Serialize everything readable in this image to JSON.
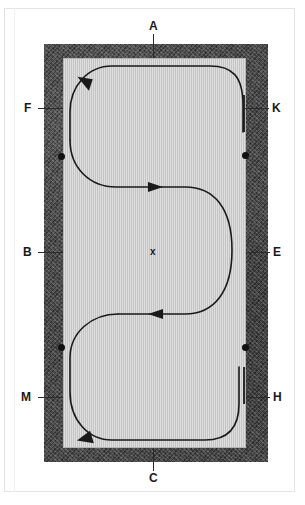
{
  "figure": {
    "type": "technical-diagram",
    "colors": {
      "wall": "#4a4a4a",
      "floor": "#c4c4c4",
      "path": "#1a1a1a",
      "page_rule": "#e4e4e4",
      "label_text": "#1a1a1a"
    }
  },
  "labels": [
    {
      "id": "A",
      "text": "A",
      "position": "top-center",
      "x": 153,
      "y": 26
    },
    {
      "id": "F",
      "text": "F",
      "position": "left-upper",
      "x": 28,
      "y": 108
    },
    {
      "id": "K",
      "text": "K",
      "position": "right-upper",
      "x": 276,
      "y": 108
    },
    {
      "id": "B",
      "text": "B",
      "position": "left-middle",
      "x": 27,
      "y": 252
    },
    {
      "id": "E",
      "text": "E",
      "position": "right-middle",
      "x": 277,
      "y": 252
    },
    {
      "id": "M",
      "text": "M",
      "position": "left-lower",
      "x": 26,
      "y": 397
    },
    {
      "id": "H",
      "text": "H",
      "position": "right-lower",
      "x": 277,
      "y": 397
    },
    {
      "id": "C",
      "text": "C",
      "position": "bottom-center",
      "x": 153,
      "y": 478
    },
    {
      "id": "x",
      "text": "x",
      "position": "interior-center",
      "x": 153,
      "y": 251
    }
  ],
  "markers": {
    "dots": [
      {
        "name": "dot-left-upper",
        "x": 61,
        "y": 156
      },
      {
        "name": "dot-right-upper",
        "x": 245,
        "y": 155
      },
      {
        "name": "dot-left-lower",
        "x": 61,
        "y": 347
      },
      {
        "name": "dot-right-lower",
        "x": 245,
        "y": 347
      }
    ],
    "wall_slots": [
      {
        "name": "slot-upper-right",
        "x": 243,
        "y_start": 95,
        "y_end": 132
      },
      {
        "name": "slot-lower-right",
        "x": 243,
        "y_start": 367,
        "y_end": 404
      }
    ]
  },
  "path": {
    "name": "serpentine-travel-path",
    "arrowheads": [
      {
        "name": "arrow-upper-left",
        "x": 88,
        "y": 82,
        "direction": "left"
      },
      {
        "name": "arrow-middle-right",
        "x": 155,
        "y": 187,
        "direction": "right"
      },
      {
        "name": "arrow-middle-left",
        "x": 158,
        "y": 314,
        "direction": "left"
      },
      {
        "name": "arrow-lower-left",
        "x": 92,
        "y": 436,
        "direction": "down-left"
      }
    ]
  }
}
